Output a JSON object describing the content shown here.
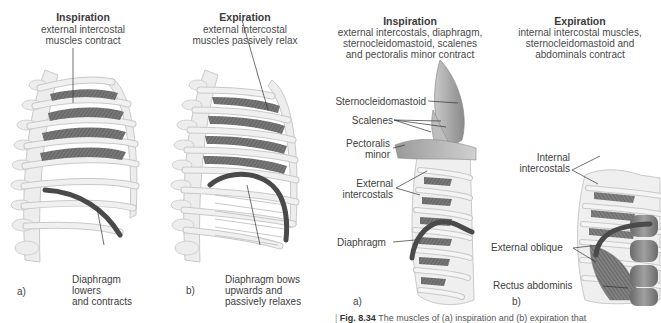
{
  "panels": [
    {
      "id": "a-left",
      "letter": "a)",
      "title": "Inspiration",
      "subtitle_lines": [
        "external intercostal",
        "muscles contract"
      ],
      "labels": [
        {
          "text_lines": [
            "Diaphragm",
            "lowers",
            "and contracts"
          ]
        }
      ]
    },
    {
      "id": "b-left",
      "letter": "b)",
      "title": "Expiration",
      "subtitle_lines": [
        "external intercostal",
        "muscles passively relax"
      ],
      "labels": [
        {
          "text_lines": [
            "Diaphragm bows",
            "upwards and",
            "passively relaxes"
          ]
        }
      ]
    },
    {
      "id": "a-right",
      "letter": "a)",
      "title": "Inspiration",
      "subtitle_lines": [
        "external intercostals, diaphragm,",
        "sternocleidomastoid, scalenes",
        "and pectoralis minor contract"
      ],
      "labels": [
        {
          "text_lines": [
            "Sternocleidomastoid"
          ]
        },
        {
          "text_lines": [
            "Scalenes"
          ]
        },
        {
          "text_lines": [
            "Pectoralis",
            "minor"
          ]
        },
        {
          "text_lines": [
            "External",
            "intercostals"
          ]
        },
        {
          "text_lines": [
            "Diaphragm"
          ]
        }
      ]
    },
    {
      "id": "b-right",
      "letter": "b)",
      "title": "Expiration",
      "subtitle_lines": [
        "internal intercostal muscles,",
        "sternocleidomastoid and",
        "abdominals contract"
      ],
      "labels": [
        {
          "text_lines": [
            "Internal",
            "intercostals"
          ]
        },
        {
          "text_lines": [
            "External oblique"
          ]
        },
        {
          "text_lines": [
            "Rectus abdominis"
          ]
        }
      ]
    }
  ],
  "caption": {
    "prefix": "Fig. 8.34",
    "text": "The muscles of (a) inspiration and (b) expiration that"
  },
  "colors": {
    "bone": "#ededed",
    "bone_outline": "#c9c9c9",
    "muscle": "#6e6e6e",
    "muscle_light": "#9a9a9a",
    "diaphragm": "#4a4a4a",
    "leader": "#333333"
  }
}
